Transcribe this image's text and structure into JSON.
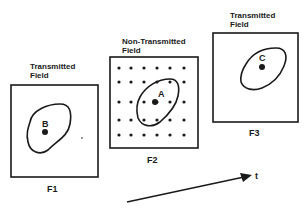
{
  "frames": [
    {
      "id": "F1",
      "label": "F1",
      "title_line1": "Transmitted",
      "title_line2": "Field",
      "point": "B",
      "dotted": false
    },
    {
      "id": "F2",
      "label": "F2",
      "title_line1": "Non-Transmitted",
      "title_line2": "Field",
      "point": "A",
      "dotted": true
    },
    {
      "id": "F3",
      "label": "F3",
      "title_line1": "Transmitted",
      "title_line2": "Field",
      "point": "C",
      "dotted": false
    }
  ],
  "axis": {
    "label": "t"
  },
  "colors": {
    "stroke": "#1a1a1a",
    "background": "#ffffff"
  }
}
